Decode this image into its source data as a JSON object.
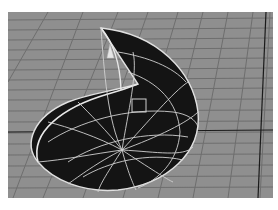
{
  "viewport": {
    "label": "Perspective viewport",
    "background_color": "#8f8f8f",
    "grid_color": "#6e6e6e",
    "axis_color": "#1a1a1a"
  },
  "object": {
    "name": "hemisphere",
    "fill_color": "#141414",
    "wire_color": "#d8d8d8",
    "state": "selected"
  },
  "gizmo": {
    "name": "view-cone-indicator",
    "color": "#e6e6e6"
  },
  "pivot": {
    "name": "pivot-handle",
    "color": "#cfcfcf"
  }
}
